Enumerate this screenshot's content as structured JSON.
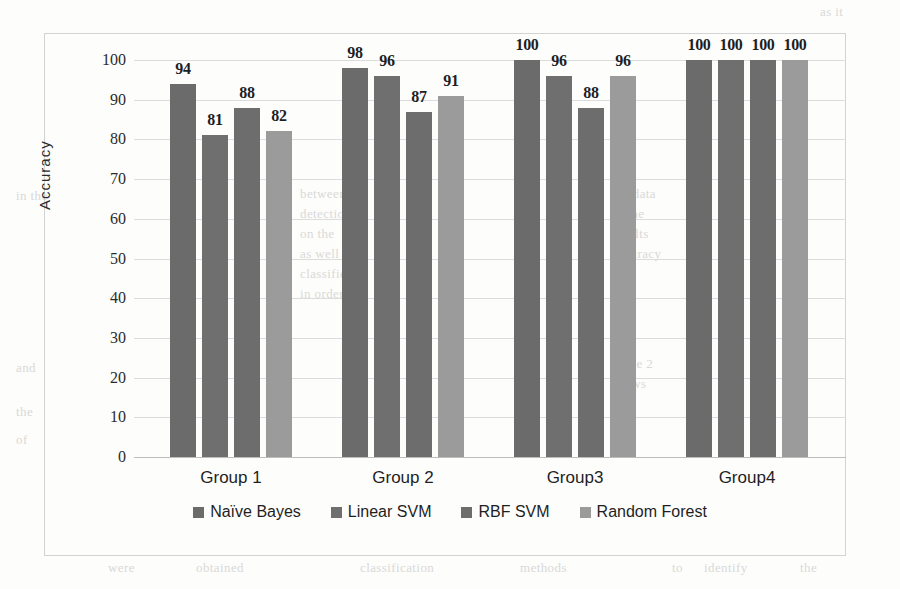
{
  "chart_data": {
    "type": "bar",
    "title": "",
    "subtitle": "",
    "xlabel": "",
    "ylabel": "Accuracy",
    "ylim": [
      0,
      100
    ],
    "ytick_step": 10,
    "yticks": [
      100,
      90,
      80,
      70,
      60,
      50,
      40,
      30,
      20,
      10,
      0
    ],
    "grid": true,
    "legend_position": "bottom",
    "categories": [
      "Group 1",
      "Group 2",
      "Group3",
      "Group4"
    ],
    "series": [
      {
        "name": "Naïve Bayes",
        "color": "#6b6b6b",
        "values": [
          94,
          98,
          100,
          100
        ]
      },
      {
        "name": "Linear SVM",
        "color": "#6f6f6f",
        "values": [
          81,
          96,
          96,
          100
        ]
      },
      {
        "name": "RBF SVM",
        "color": "#6d6d6d",
        "values": [
          88,
          87,
          88,
          100
        ]
      },
      {
        "name": "Random Forest",
        "color": "#9b9b9b",
        "values": [
          82,
          91,
          96,
          100
        ]
      }
    ],
    "data_labels": [
      [
        "94",
        "81",
        "88",
        "82"
      ],
      [
        "98",
        "96",
        "87",
        "91"
      ],
      [
        "100",
        "96",
        "88",
        "96"
      ],
      [
        "100",
        "100",
        "100",
        "100"
      ]
    ]
  },
  "legend": {
    "items": [
      {
        "label": "Naïve Bayes",
        "color": "#6b6b6b"
      },
      {
        "label": "Linear SVM",
        "color": "#6f6f6f"
      },
      {
        "label": "RBF SVM",
        "color": "#6d6d6d"
      },
      {
        "label": "Random Forest",
        "color": "#9b9b9b"
      }
    ]
  },
  "background_bleed": [
    {
      "text": "as it",
      "x": 820,
      "y": 4
    },
    {
      "text": "in the",
      "x": 16,
      "y": 188
    },
    {
      "text": "between",
      "x": 300,
      "y": 186
    },
    {
      "text": "detection",
      "x": 300,
      "y": 206
    },
    {
      "text": "on the",
      "x": 300,
      "y": 226
    },
    {
      "text": "as well as",
      "x": 300,
      "y": 246
    },
    {
      "text": "classifier",
      "x": 300,
      "y": 266
    },
    {
      "text": "in order to",
      "x": 300,
      "y": 286
    },
    {
      "text": "the data",
      "x": 612,
      "y": 186
    },
    {
      "text": "of the",
      "x": 612,
      "y": 206
    },
    {
      "text": "results",
      "x": 612,
      "y": 226
    },
    {
      "text": "accuracy",
      "x": 612,
      "y": 246
    },
    {
      "text": "Table 2",
      "x": 612,
      "y": 356
    },
    {
      "text": "shows",
      "x": 612,
      "y": 376
    },
    {
      "text": "and",
      "x": 16,
      "y": 360
    },
    {
      "text": "the",
      "x": 16,
      "y": 404
    },
    {
      "text": "of",
      "x": 16,
      "y": 432
    },
    {
      "text": "were",
      "x": 108,
      "y": 560
    },
    {
      "text": "obtained",
      "x": 196,
      "y": 560
    },
    {
      "text": "classification",
      "x": 360,
      "y": 560
    },
    {
      "text": "methods",
      "x": 520,
      "y": 560
    },
    {
      "text": "to",
      "x": 672,
      "y": 560
    },
    {
      "text": "identify",
      "x": 704,
      "y": 560
    },
    {
      "text": "the",
      "x": 800,
      "y": 560
    }
  ]
}
